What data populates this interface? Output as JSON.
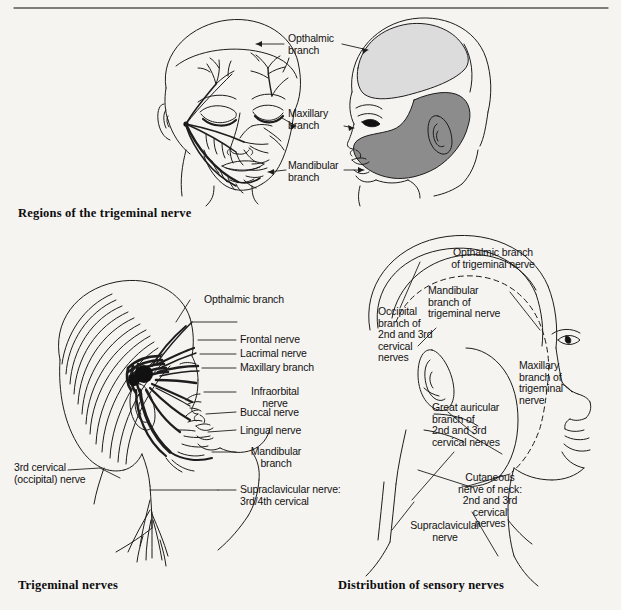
{
  "page": {
    "background_color": "#f6f4f1",
    "ink_color": "#121212",
    "top_rule": true
  },
  "figures": [
    {
      "id": "fig-regions-trigeminal",
      "caption": "Regions of the trigeminal nerve",
      "type": "anatomical-illustration",
      "views": [
        "three-quarter face with nerve branches",
        "lateral profile with shaded dermatome regions"
      ],
      "labels": [
        {
          "id": "opthalmic",
          "text": "Opthalmic\nbranch"
        },
        {
          "id": "maxillary",
          "text": "Maxillary\nbranch"
        },
        {
          "id": "mandibular",
          "text": "Mandibular\nbranch"
        }
      ],
      "shading": [
        {
          "region": "opthalmic",
          "tone": "light stipple"
        },
        {
          "region": "maxillary",
          "tone": "unshaded"
        },
        {
          "region": "mandibular",
          "tone": "dark stipple"
        }
      ]
    },
    {
      "id": "fig-trigeminal-nerves",
      "caption": "Trigeminal nerves",
      "type": "anatomical-illustration",
      "views": [
        "lateral head and neck with nerve tracts"
      ],
      "labels": [
        {
          "id": "opthalmic-branch",
          "text": "Opthalmic branch"
        },
        {
          "id": "frontal-nerve",
          "text": "Frontal nerve"
        },
        {
          "id": "lacrimal-nerve",
          "text": "Lacrimal nerve"
        },
        {
          "id": "maxillary-branch",
          "text": "Maxillary branch"
        },
        {
          "id": "infraorbital-nerve",
          "text": "Infraorbital\nnerve"
        },
        {
          "id": "buccal-nerve",
          "text": "Buccal nerve"
        },
        {
          "id": "lingual-nerve",
          "text": "Lingual nerve"
        },
        {
          "id": "mandibular-branch",
          "text": "Mandibular\nbranch"
        },
        {
          "id": "third-cervical",
          "text": "3rd cervical\n(occipital) nerve"
        },
        {
          "id": "supraclavicular",
          "text": "Supraclavicular nerve:\n3rd/4th cervical"
        }
      ]
    },
    {
      "id": "fig-distribution-sensory",
      "caption": "Distribution of sensory nerves",
      "type": "anatomical-illustration",
      "views": [
        "lateral head and neck with dermatome boundaries"
      ],
      "labels": [
        {
          "id": "opthalmic-trigeminal",
          "text": "Opthalmic branch\nof trigeminal nerve"
        },
        {
          "id": "mandibular-trigeminal",
          "text": "Mandibular\nbranch of\ntrigeminal nerve"
        },
        {
          "id": "occipital-cervical",
          "text": "Occipital\nbranch of\n2nd and 3rd\ncervical\nnerves"
        },
        {
          "id": "maxillary-trigeminal",
          "text": "Maxillary\nbranch of\ntrigeminal\nnerve"
        },
        {
          "id": "great-auricular",
          "text": "Great auricular\nbranch of\n2nd and 3rd\ncervical nerves"
        },
        {
          "id": "cutaneous-neck",
          "text": "Cutaneous\nnerve of neck:\n2nd and 3rd\ncervical\nnerves"
        },
        {
          "id": "supraclavicular-nerve",
          "text": "Supraclavicular\nnerve"
        }
      ]
    }
  ]
}
